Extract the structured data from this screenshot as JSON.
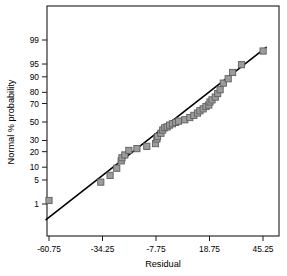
{
  "chart_data": {
    "type": "scatter",
    "title": "",
    "subtitle": "",
    "xlabel": "Residual",
    "ylabel": "Normal % probability",
    "grid": false,
    "legend": null,
    "xlim": [
      -60.75,
      45.25
    ],
    "ylim_probability": [
      1,
      99
    ],
    "xticks": [
      "-60.75",
      "-34.25",
      "-7.75",
      "18.75",
      "45.25"
    ],
    "xtick_values": [
      -60.75,
      -34.25,
      -7.75,
      18.75,
      45.25
    ],
    "yticks": [
      "99",
      "95",
      "90",
      "80",
      "70",
      "50",
      "30",
      "20",
      "10",
      "5",
      "1"
    ],
    "ytick_values": [
      99,
      95,
      90,
      80,
      70,
      50,
      30,
      20,
      10,
      5,
      1
    ],
    "reference_line": {
      "label": "normal reference line",
      "x_start": -62.2,
      "x_end": 46.8,
      "p_start": 0.28,
      "p_end": 98.3
    },
    "series": [
      {
        "name": "residuals",
        "marker": "square",
        "color": "#9c9c9c",
        "edge_color": "#5e5e5e",
        "points": [
          {
            "x": -60.75,
            "p": 1.3
          },
          {
            "x": -35.1,
            "p": 4.4
          },
          {
            "x": -30.5,
            "p": 6.5
          },
          {
            "x": -27.2,
            "p": 9.5
          },
          {
            "x": -25.0,
            "p": 13.5
          },
          {
            "x": -24.6,
            "p": 15.5
          },
          {
            "x": -23.2,
            "p": 17.5
          },
          {
            "x": -21.2,
            "p": 21.0
          },
          {
            "x": -17.2,
            "p": 22.5
          },
          {
            "x": -12.3,
            "p": 24.5
          },
          {
            "x": -8.0,
            "p": 27.0
          },
          {
            "x": -7.3,
            "p": 31.5
          },
          {
            "x": -7.0,
            "p": 34.0
          },
          {
            "x": -5.3,
            "p": 37.5
          },
          {
            "x": -4.4,
            "p": 41.0
          },
          {
            "x": -3.4,
            "p": 43.5
          },
          {
            "x": -2.2,
            "p": 44.5
          },
          {
            "x": -1.0,
            "p": 46.5
          },
          {
            "x": 0.4,
            "p": 48.0
          },
          {
            "x": 2.0,
            "p": 49.5
          },
          {
            "x": 3.4,
            "p": 51.0
          },
          {
            "x": 6.5,
            "p": 52.5
          },
          {
            "x": 9.0,
            "p": 55.0
          },
          {
            "x": 11.0,
            "p": 57.5
          },
          {
            "x": 12.8,
            "p": 60.0
          },
          {
            "x": 14.0,
            "p": 62.5
          },
          {
            "x": 15.6,
            "p": 64.5
          },
          {
            "x": 17.0,
            "p": 67.0
          },
          {
            "x": 18.4,
            "p": 68.5
          },
          {
            "x": 19.0,
            "p": 71.5
          },
          {
            "x": 20.0,
            "p": 73.5
          },
          {
            "x": 21.6,
            "p": 76.0
          },
          {
            "x": 22.8,
            "p": 79.0
          },
          {
            "x": 24.0,
            "p": 82.0
          },
          {
            "x": 25.6,
            "p": 86.5
          },
          {
            "x": 28.0,
            "p": 89.0
          },
          {
            "x": 30.2,
            "p": 92.0
          },
          {
            "x": 34.6,
            "p": 94.8
          },
          {
            "x": 45.3,
            "p": 97.8
          }
        ]
      }
    ]
  },
  "axes": {
    "x_title": "Residual",
    "y_title": "Normal % probability"
  }
}
